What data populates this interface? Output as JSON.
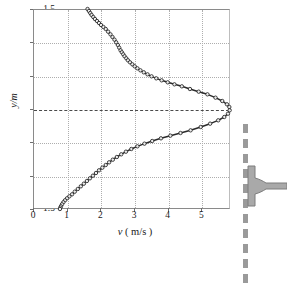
{
  "figure": {
    "kind": "velocity-profile-plot",
    "background": "#ffffff"
  },
  "axes": {
    "x_title_symbol": "v",
    "x_title_unit": " ( m/s )",
    "y_title": "y/m",
    "x_ticks": [
      "0",
      "1",
      "2",
      "3",
      "4",
      "5"
    ],
    "x_tick_values": [
      0,
      1,
      2,
      3,
      4,
      5
    ],
    "y_ticks": [
      "1.5",
      "1.0",
      "0.5",
      "0",
      "-0.5",
      "-1.0",
      "-1.5"
    ],
    "y_tick_values": [
      1.5,
      1.0,
      0.5,
      0,
      -0.5,
      -1.0,
      -1.5
    ],
    "xlim": [
      0,
      5.85
    ],
    "ylim": [
      -1.5,
      1.5
    ],
    "grid": "dotted",
    "grid_color": "#aeaeae",
    "zero_line_color": "#4a4a4a",
    "frame_color": "#8a8a8a"
  },
  "inset": {
    "dashed_line_name": "jet-centerline-dashed",
    "dashed_line_color": "#9a9a9a",
    "nozzle_name": "nozzle-outlet",
    "nozzle_fill": "#a9a9a9",
    "nozzle_edge": "#7d7d7d"
  },
  "chart_data": {
    "type": "scatter",
    "title": "",
    "subtitle": "",
    "xlabel": "v ( m/s )",
    "ylabel": "y/m",
    "xlim": [
      0,
      5.85
    ],
    "ylim": [
      -1.5,
      1.5
    ],
    "grid": true,
    "legend": "none",
    "marker": "open-circle",
    "marker_color": "#2a2a2a",
    "line_color": "#2a2a2a",
    "annotation": "Jet velocity profile measured downstream of a nozzle; dashed line marks the jet centerline.",
    "series": [
      {
        "name": "velocity profile",
        "x": [
          1.62,
          1.66,
          1.7,
          1.74,
          1.79,
          1.84,
          1.9,
          1.96,
          2.02,
          2.09,
          2.16,
          2.23,
          2.3,
          2.36,
          2.42,
          2.47,
          2.52,
          2.56,
          2.6,
          2.64,
          2.68,
          2.72,
          2.77,
          2.82,
          2.88,
          2.95,
          3.02,
          3.1,
          3.19,
          3.29,
          3.4,
          3.52,
          3.66,
          3.82,
          4.0,
          4.2,
          4.42,
          4.66,
          4.92,
          5.18,
          5.42,
          5.62,
          5.76,
          5.83,
          5.84,
          5.79,
          5.68,
          5.5,
          5.26,
          4.98,
          4.68,
          4.38,
          4.08,
          3.8,
          3.54,
          3.31,
          3.1,
          2.92,
          2.76,
          2.62,
          2.49,
          2.37,
          2.26,
          2.16,
          2.06,
          1.96,
          1.87,
          1.78,
          1.69,
          1.6,
          1.51,
          1.42,
          1.33,
          1.24,
          1.16,
          1.08,
          1.01,
          0.95,
          0.9,
          0.86,
          0.83,
          0.81,
          0.8
        ],
        "y": [
          1.5,
          1.47,
          1.44,
          1.41,
          1.38,
          1.35,
          1.32,
          1.29,
          1.26,
          1.23,
          1.2,
          1.16,
          1.12,
          1.08,
          1.04,
          1.0,
          0.96,
          0.92,
          0.88,
          0.85,
          0.82,
          0.79,
          0.76,
          0.73,
          0.7,
          0.67,
          0.64,
          0.61,
          0.58,
          0.55,
          0.52,
          0.49,
          0.46,
          0.43,
          0.4,
          0.37,
          0.34,
          0.3,
          0.26,
          0.22,
          0.17,
          0.12,
          0.07,
          0.03,
          -0.02,
          -0.07,
          -0.12,
          -0.17,
          -0.22,
          -0.27,
          -0.32,
          -0.36,
          -0.4,
          -0.44,
          -0.48,
          -0.52,
          -0.56,
          -0.6,
          -0.64,
          -0.68,
          -0.72,
          -0.76,
          -0.8,
          -0.84,
          -0.88,
          -0.92,
          -0.96,
          -1.0,
          -1.04,
          -1.08,
          -1.12,
          -1.16,
          -1.2,
          -1.24,
          -1.28,
          -1.31,
          -1.34,
          -1.37,
          -1.4,
          -1.43,
          -1.46,
          -1.48,
          -1.5
        ]
      }
    ],
    "key_points": {
      "peak_velocity": 5.84,
      "peak_velocity_y": 0.0,
      "top_end_velocity": 1.62,
      "top_end_y": 1.5,
      "bottom_end_velocity": 0.8,
      "bottom_end_y": -1.5,
      "upper_shoulder_velocity": 2.5,
      "upper_shoulder_y": 0.85
    }
  }
}
